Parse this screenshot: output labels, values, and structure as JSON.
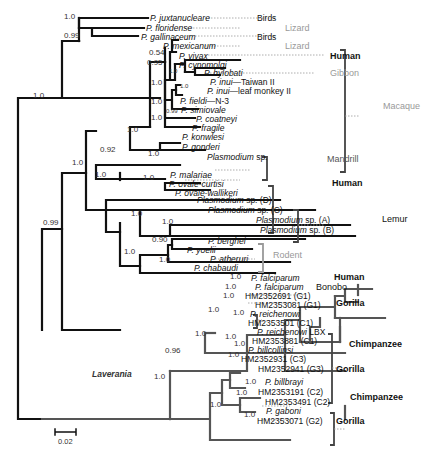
{
  "taxa": {
    "juxtanucleare": "P. juxtanucleare",
    "floridense": "P. floridense",
    "gallinaceum": "P. gallinaceum",
    "mexicanum": "P. mexicanum",
    "vivax": "P. vivax",
    "cynomolgi": "P. cynomolgi",
    "hylobati": "P. hylobati",
    "inui_taiwan": "P. inui—Taiwan II",
    "inui_leaf": "P. inui—leaf monkey II",
    "fieldi": "P. fieldi—N-3",
    "simiovale": "P. simiovale",
    "coatneyi": "P. coatneyi",
    "fragile": "P. fragile",
    "knowlesi": "P. konwlesi",
    "gonderi": "P. gonderi",
    "plasmodium_sp": "Plasmodium sp.",
    "malariae": "P. malariae",
    "ovale_curtisi": "P. ovale-curtisi",
    "ovale_wallikeri": "P. ovale-wallikeri",
    "sp_D": "Plasmodium sp. (D)",
    "sp_C": "Plasmodium sp. (C)",
    "sp_A": "Plasmodium sp. (A)",
    "sp_B": "Plasmodium sp. (B)",
    "berghei": "P. berghei",
    "yoelii": "P. yoelii",
    "atheruri": "P. atheruri",
    "chabaudi": "P. chabaudi",
    "falciparum_h": "P. falciparum",
    "falciparum_b": "P. falciparum",
    "hm2352691": "HM2352691 (G1)",
    "hm2353081": "HM2353081 (G1)",
    "reichenowi": "P. reichenowi",
    "hm2353501": "HM2353501 (C1)",
    "reichenowi_lbx": "P. reichenowi LBX",
    "hm2353881": "HM2353881 (C1)",
    "billcollinsi": "P. billcollinsi",
    "hm2352931": "HM2352931 (C3)",
    "hm2352941": "HM2352941 (G3)",
    "billbrayi": "P. billbrayi",
    "hm2353191": "HM2353191 (C2)",
    "hm2353491": "HM2353491 (C2)",
    "gaboni": "P. gaboni",
    "hm2353071": "HM2353071 (G2)"
  },
  "hosts": {
    "birds1": "Birds",
    "lizard1": "Lizard",
    "birds2": "Birds",
    "lizard2": "Lizard",
    "human1": "Human",
    "gibbon": "Gibbon",
    "macaque": "Macaque",
    "mandrill": "Mandrill",
    "human2": "Human",
    "lemur": "Lemur",
    "rodent": "Rodent",
    "human3": "Human",
    "bonobo": "Bonobo",
    "gorilla1": "Gorilla",
    "chimp1": "Chimpanzee",
    "gorilla2": "Gorilla",
    "chimp2": "Chimpanzee",
    "gorilla3": "Gorilla"
  },
  "support": {
    "root": "0.99",
    "avian_clade": "1.0",
    "jux_clade": "1.0",
    "flo_gal": "0.99",
    "vivax": "0.54",
    "cynomolgi": "0.95",
    "hylobati": "1.0",
    "inui": "1.0",
    "macaque_a": "1.0",
    "fieldi": "1.0",
    "simiovale": "0.99",
    "macaque_b": "1.0",
    "macaque_c": "1.0",
    "mandrill": "1.0",
    "primate_clade": "0.92",
    "ovale": "1.0",
    "mammal_a": "1.0",
    "lemur_a": "1.0",
    "lemur_b": "1.0",
    "lemur_c": "1.0",
    "rodent_a": "0.90",
    "rodent_b": "1.0",
    "rodent_c": "1.0",
    "lav_f1": "1.0",
    "lav_f2": "1.0",
    "lav_f3": "1.0",
    "lav_r1": "1.0",
    "lav_r2": "1.0",
    "lav_r3": "1.0",
    "lav_r4": "1.0",
    "lav_bc": "1.0",
    "lav_c1": "1.0",
    "lav_c2": "0.96",
    "lav_root": "1.0",
    "lav_g1": "1.0",
    "lav_g2": "1.0",
    "lav_g3": "1.0",
    "lav_g4": "1.0"
  },
  "clade_label": "Laverania",
  "scale": {
    "value": "0.02"
  },
  "colors": {
    "tree": "#111111",
    "laverania": "#555555",
    "host_gray": "#999999"
  }
}
